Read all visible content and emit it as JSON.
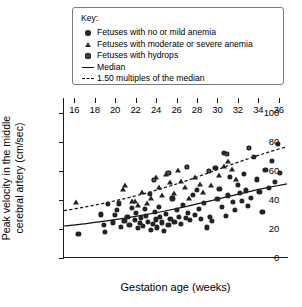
{
  "legend": {
    "title": "Key:",
    "entries": [
      {
        "marker": "filled-circle",
        "label": "Fetuses with no or mild anemia"
      },
      {
        "marker": "filled-triangle",
        "label": "Fetuses with moderate or severe anemia"
      },
      {
        "marker": "shaded-circle",
        "label": "Fetuses with hydrops"
      },
      {
        "marker": "solid-line",
        "label": "Median"
      },
      {
        "marker": "dashed-line",
        "label": "1.50 multiples of the median"
      }
    ]
  },
  "chart_data": {
    "type": "scatter",
    "title": "",
    "xlabel": "Gestation age (weeks)",
    "ylabel": "Peak velocity in the middle cerebral artery (cm/sec)",
    "xlim": [
      15,
      37
    ],
    "ylim": [
      0,
      110
    ],
    "xticks": [
      16,
      18,
      20,
      22,
      24,
      26,
      28,
      30,
      32,
      34,
      36
    ],
    "yticks": [
      0,
      20,
      40,
      60,
      80,
      100
    ],
    "grid": false,
    "legend_position": "top-center",
    "marker_colors": {
      "circle": "#232323",
      "triangle": "#232323",
      "hydrops": "#4d4d4d",
      "line": "#111111"
    },
    "series": [
      {
        "name": "Fetuses with no or mild anemia",
        "marker": "filled-circle",
        "points": [
          [
            16.4,
            16.5
          ],
          [
            18.6,
            30.0
          ],
          [
            18.9,
            22.5
          ],
          [
            19.0,
            18.0
          ],
          [
            19.3,
            37.0
          ],
          [
            19.8,
            24.5
          ],
          [
            20.0,
            29.5
          ],
          [
            20.2,
            33.0
          ],
          [
            20.4,
            37.5
          ],
          [
            20.6,
            21.5
          ],
          [
            20.9,
            25.5
          ],
          [
            21.2,
            28.5
          ],
          [
            21.4,
            23.0
          ],
          [
            21.6,
            34.5
          ],
          [
            21.9,
            26.0
          ],
          [
            22.0,
            31.0
          ],
          [
            22.2,
            20.5
          ],
          [
            22.4,
            24.0
          ],
          [
            22.5,
            27.5
          ],
          [
            22.7,
            22.0
          ],
          [
            22.9,
            33.5
          ],
          [
            23.0,
            29.0
          ],
          [
            23.2,
            25.0
          ],
          [
            23.4,
            44.0
          ],
          [
            23.5,
            19.5
          ],
          [
            23.7,
            23.5
          ],
          [
            23.9,
            31.5
          ],
          [
            24.0,
            26.5
          ],
          [
            24.1,
            21.0
          ],
          [
            24.3,
            35.0
          ],
          [
            24.4,
            28.0
          ],
          [
            24.6,
            24.5
          ],
          [
            24.8,
            18.5
          ],
          [
            25.0,
            30.5
          ],
          [
            25.2,
            22.5
          ],
          [
            25.4,
            27.0
          ],
          [
            25.6,
            41.0
          ],
          [
            25.8,
            25.0
          ],
          [
            26.0,
            33.0
          ],
          [
            26.2,
            28.5
          ],
          [
            26.4,
            23.5
          ],
          [
            26.6,
            36.5
          ],
          [
            26.9,
            27.5
          ],
          [
            27.1,
            31.0
          ],
          [
            27.3,
            26.0
          ],
          [
            27.6,
            43.5
          ],
          [
            27.8,
            29.5
          ],
          [
            28.0,
            47.0
          ],
          [
            28.2,
            33.5
          ],
          [
            28.4,
            27.0
          ],
          [
            28.7,
            38.0
          ],
          [
            29.0,
            21.0
          ],
          [
            29.3,
            28.5
          ],
          [
            29.5,
            25.5
          ],
          [
            29.8,
            62.0
          ],
          [
            30.0,
            40.5
          ],
          [
            30.2,
            47.5
          ],
          [
            30.4,
            35.0
          ],
          [
            30.6,
            72.0
          ],
          [
            30.8,
            29.0
          ],
          [
            31.0,
            43.0
          ],
          [
            31.2,
            56.0
          ],
          [
            31.5,
            38.5
          ],
          [
            31.7,
            33.0
          ],
          [
            32.0,
            50.5
          ],
          [
            32.2,
            44.5
          ],
          [
            32.4,
            39.0
          ],
          [
            32.6,
            58.0
          ],
          [
            32.8,
            46.5
          ],
          [
            33.0,
            36.0
          ],
          [
            33.3,
            41.5
          ],
          [
            33.6,
            69.5
          ],
          [
            33.9,
            54.0
          ],
          [
            34.1,
            45.5
          ],
          [
            34.4,
            31.5
          ],
          [
            34.7,
            60.5
          ],
          [
            35.0,
            48.0
          ],
          [
            35.3,
            66.5
          ],
          [
            35.6,
            52.5
          ],
          [
            35.9,
            78.5
          ],
          [
            36.1,
            58.5
          ]
        ]
      },
      {
        "name": "Fetuses with moderate or severe anemia",
        "marker": "filled-triangle",
        "points": [
          [
            16.2,
            38.5
          ],
          [
            20.8,
            47.5
          ],
          [
            21.0,
            50.5
          ],
          [
            21.6,
            39.0
          ],
          [
            21.9,
            39.5
          ],
          [
            22.2,
            36.5
          ],
          [
            22.6,
            45.5
          ],
          [
            23.1,
            37.5
          ],
          [
            23.5,
            41.5
          ],
          [
            24.0,
            55.5
          ],
          [
            24.3,
            48.5
          ],
          [
            24.6,
            43.0
          ],
          [
            25.0,
            57.5
          ],
          [
            25.4,
            52.0
          ],
          [
            25.8,
            45.0
          ],
          [
            26.1,
            60.5
          ],
          [
            26.4,
            53.0
          ],
          [
            26.8,
            49.0
          ],
          [
            27.2,
            41.0
          ],
          [
            27.8,
            56.0
          ],
          [
            28.3,
            51.0
          ],
          [
            28.6,
            45.5
          ],
          [
            29.4,
            50.0
          ],
          [
            30.2,
            57.0
          ],
          [
            30.6,
            63.0
          ],
          [
            31.0,
            66.5
          ],
          [
            31.4,
            61.0
          ],
          [
            31.8,
            54.5
          ]
        ]
      },
      {
        "name": "Fetuses with hydrops",
        "marker": "shaded-circle",
        "points": [
          [
            23.8,
            53.5
          ],
          [
            25.2,
            58.5
          ],
          [
            27.0,
            62.5
          ],
          [
            29.2,
            60.0
          ],
          [
            30.9,
            71.5
          ],
          [
            33.1,
            75.5
          ]
        ]
      }
    ],
    "curves": [
      {
        "name": "Median",
        "style": "solid",
        "points": [
          [
            15.0,
            22.0
          ],
          [
            17.0,
            23.5
          ],
          [
            19.0,
            25.3
          ],
          [
            21.0,
            27.4
          ],
          [
            23.0,
            29.8
          ],
          [
            25.0,
            32.5
          ],
          [
            27.0,
            35.5
          ],
          [
            29.0,
            38.8
          ],
          [
            31.0,
            42.2
          ],
          [
            33.0,
            45.5
          ],
          [
            35.0,
            48.5
          ],
          [
            36.8,
            51.0
          ]
        ]
      },
      {
        "name": "1.50 multiples of the median",
        "style": "dashed",
        "points": [
          [
            15.0,
            32.5
          ],
          [
            17.0,
            35.0
          ],
          [
            19.0,
            37.8
          ],
          [
            21.0,
            41.0
          ],
          [
            23.0,
            44.6
          ],
          [
            25.0,
            48.7
          ],
          [
            27.0,
            53.2
          ],
          [
            29.0,
            58.2
          ],
          [
            31.0,
            63.3
          ],
          [
            33.0,
            68.2
          ],
          [
            35.0,
            72.8
          ],
          [
            36.8,
            76.5
          ]
        ]
      }
    ]
  }
}
